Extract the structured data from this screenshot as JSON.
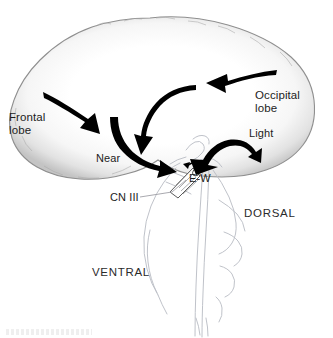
{
  "figure": {
    "background_color": "#ffffff",
    "width": 333,
    "height": 338
  },
  "colors": {
    "arrow": "#000000",
    "brain_outline": "#8f8f8f",
    "brain_fill_edge": "#c9c9c9",
    "brain_fill_center": "#ffffff",
    "brainstem_outline": "#b9bcc4",
    "text": "#1c1c1c",
    "leader_line": "#9a9aa0"
  },
  "labels": {
    "frontal_lobe_line1": "Frontal",
    "frontal_lobe_line2": "lobe",
    "occipital_lobe_line1": "Occipital",
    "occipital_lobe_line2": "lobe",
    "light": "Light",
    "near": "Near",
    "cn_iii": "CN III",
    "ew_nucleus": "E-W",
    "dorsal": "DORSAL",
    "ventral": "VENTRAL"
  },
  "anatomy": {
    "structures": [
      "cerebral hemisphere",
      "brainstem",
      "midbrain",
      "oculomotor nerve",
      "Edinger-Westphal nucleus"
    ]
  },
  "arrows": [
    {
      "name": "frontal-to-midbrain-arrow",
      "from": "Frontal lobe",
      "to": "midbrain",
      "pathway": "Near",
      "heads": 1
    },
    {
      "name": "occipital-to-cortex-arrow",
      "from": "Occipital lobe",
      "to": "parietal cortex",
      "pathway": "Light",
      "heads": 1
    },
    {
      "name": "cortex-descending-arrow",
      "from": "parietal cortex",
      "to": "midbrain",
      "pathway": "Near",
      "heads": 1
    },
    {
      "name": "near-converging-arrow",
      "from": "descending tract",
      "to": "E-W nucleus",
      "pathway": "Near",
      "heads": 1
    },
    {
      "name": "light-arch-arrow",
      "from": "pretectal area",
      "to": "E-W nucleus",
      "pathway": "Light",
      "heads": 2
    },
    {
      "name": "ew-to-cn3-arrow",
      "from": "E-W nucleus",
      "to": "CN III",
      "pathway": "efferent",
      "heads": 1
    }
  ]
}
